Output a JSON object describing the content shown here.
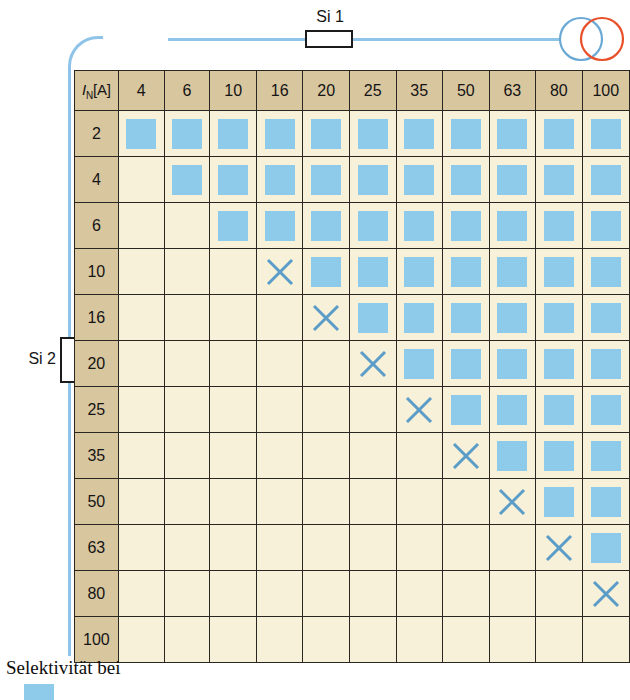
{
  "circuit": {
    "upstream_fuse_label": "Si 1",
    "downstream_fuse_label": "Si 2",
    "source_icon": "overlapping-circles-generator-icon",
    "source_color_primary": "#6aa9d6",
    "source_color_secondary": "#e8502a",
    "wire_color": "#8fc3e8"
  },
  "matrix": {
    "corner_header_symbol": "I",
    "corner_header_subscript": "N",
    "corner_header_unit": "[A]",
    "columns": [
      "4",
      "6",
      "10",
      "16",
      "20",
      "25",
      "35",
      "50",
      "63",
      "80",
      "100"
    ],
    "rows": [
      "2",
      "4",
      "6",
      "10",
      "16",
      "20",
      "25",
      "35",
      "50",
      "63",
      "80",
      "100"
    ],
    "marker_selective": "filled-square",
    "marker_nonselective": "x-cross",
    "marker_empty": "",
    "cells": [
      [
        "sq",
        "sq",
        "sq",
        "sq",
        "sq",
        "sq",
        "sq",
        "sq",
        "sq",
        "sq",
        "sq"
      ],
      [
        "",
        "sq",
        "sq",
        "sq",
        "sq",
        "sq",
        "sq",
        "sq",
        "sq",
        "sq",
        "sq"
      ],
      [
        "",
        "",
        "sq",
        "sq",
        "sq",
        "sq",
        "sq",
        "sq",
        "sq",
        "sq",
        "sq"
      ],
      [
        "",
        "",
        "",
        "x",
        "sq",
        "sq",
        "sq",
        "sq",
        "sq",
        "sq",
        "sq"
      ],
      [
        "",
        "",
        "",
        "",
        "x",
        "sq",
        "sq",
        "sq",
        "sq",
        "sq",
        "sq"
      ],
      [
        "",
        "",
        "",
        "",
        "",
        "x",
        "sq",
        "sq",
        "sq",
        "sq",
        "sq"
      ],
      [
        "",
        "",
        "",
        "",
        "",
        "",
        "x",
        "sq",
        "sq",
        "sq",
        "sq"
      ],
      [
        "",
        "",
        "",
        "",
        "",
        "",
        "",
        "x",
        "sq",
        "sq",
        "sq"
      ],
      [
        "",
        "",
        "",
        "",
        "",
        "",
        "",
        "",
        "x",
        "sq",
        "sq"
      ],
      [
        "",
        "",
        "",
        "",
        "",
        "",
        "",
        "",
        "",
        "x",
        "sq"
      ],
      [
        "",
        "",
        "",
        "",
        "",
        "",
        "",
        "",
        "",
        "",
        "x"
      ],
      [
        "",
        "",
        "",
        "",
        "",
        "",
        "",
        "",
        "",
        "",
        ""
      ]
    ]
  },
  "caption": {
    "text": "Selektivität bei",
    "legend_swatch_color": "#8ecaea"
  },
  "colors": {
    "header_background": "#d8c69f",
    "cell_background": "#f8f1da",
    "grid_line": "#2a2622",
    "selective_blue": "#8ecaea",
    "cross_blue": "#5b9dc8"
  }
}
